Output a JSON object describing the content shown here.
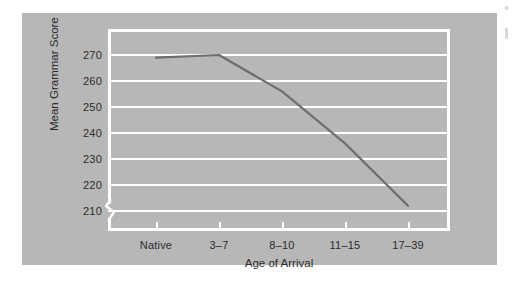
{
  "chart_data": {
    "type": "line",
    "title": "",
    "xlabel": "Age of Arrival",
    "ylabel": "Mean Grammar Score",
    "categories": [
      "Native",
      "3–7",
      "8–10",
      "11–15",
      "17–39"
    ],
    "values": [
      269,
      270,
      256,
      236,
      212
    ],
    "series": [
      {
        "name": "Mean Grammar Score",
        "values": [
          269,
          270,
          256,
          236,
          212
        ]
      }
    ],
    "ylim": [
      205,
      275
    ],
    "yticks": [
      210,
      220,
      230,
      240,
      250,
      260,
      270
    ],
    "ytick_labels": [
      "210",
      "220",
      "230",
      "240",
      "250",
      "260",
      "270"
    ],
    "xtick_labels": [
      "Native",
      "3–7",
      "8–10",
      "11–15",
      "17–39"
    ],
    "grid": true,
    "grid_orientation": "horizontal",
    "grid_color": "#ffffff",
    "legend": false,
    "legend_position": "none",
    "axis_break": true,
    "axis_break_axis": "y",
    "line_color": "#6e6e6e",
    "panel_color": "#b7b7b7",
    "text_color": "#2b2b2b",
    "annotations": []
  }
}
